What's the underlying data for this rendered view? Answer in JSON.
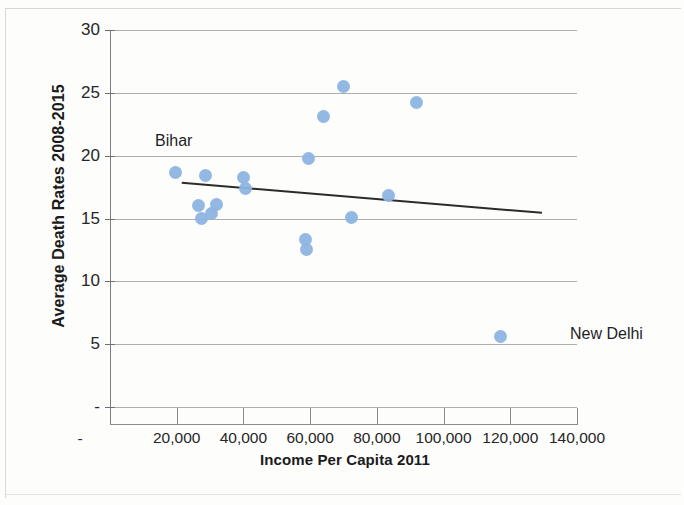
{
  "chart_data": {
    "type": "scatter",
    "title": "",
    "xlabel": "Income Per Capita 2011",
    "ylabel": "Average Death Rates 2008-2015",
    "xlim": [
      0,
      140000
    ],
    "ylim": [
      0,
      30
    ],
    "xticks": [
      0,
      20000,
      40000,
      60000,
      80000,
      100000,
      120000,
      140000
    ],
    "xticklabels": [
      "-",
      "20,000",
      "40,000",
      "60,000",
      "80,000",
      "100,000",
      "120,000",
      "140,000"
    ],
    "yticks": [
      0,
      5,
      10,
      15,
      20,
      25,
      30
    ],
    "yticklabels": [
      "-",
      "5",
      "10",
      "15",
      "20",
      "25",
      "30"
    ],
    "grid": "horizontal",
    "legend": "none",
    "marker_color": "#8db4e2",
    "trendline_color": "#2b2b2b",
    "points": [
      {
        "x": 19500,
        "y": 18.7
      },
      {
        "x": 26500,
        "y": 16.0
      },
      {
        "x": 27500,
        "y": 15.0
      },
      {
        "x": 28500,
        "y": 18.4
      },
      {
        "x": 30500,
        "y": 15.4
      },
      {
        "x": 32000,
        "y": 16.1
      },
      {
        "x": 40000,
        "y": 18.3
      },
      {
        "x": 40500,
        "y": 17.4
      },
      {
        "x": 58500,
        "y": 13.3
      },
      {
        "x": 59000,
        "y": 12.5
      },
      {
        "x": 59500,
        "y": 19.8
      },
      {
        "x": 64000,
        "y": 23.1
      },
      {
        "x": 70000,
        "y": 25.5
      },
      {
        "x": 72500,
        "y": 15.1
      },
      {
        "x": 83500,
        "y": 16.8
      },
      {
        "x": 92000,
        "y": 24.2
      },
      {
        "x": 117000,
        "y": 5.6
      }
    ],
    "trendline": {
      "x0": 21500,
      "y0": 17.85,
      "x1": 129500,
      "y1": 15.45
    },
    "annotations": [
      {
        "text": "Bihar",
        "x": 19500,
        "y": 18.7,
        "label_x": 155,
        "label_y": 132
      },
      {
        "text": "New Delhi",
        "x": 117000,
        "y": 5.6,
        "label_x": 570,
        "label_y": 325
      }
    ]
  },
  "axes": {
    "y_title": "Average Death Rates 2008-2015",
    "x_title": "Income Per Capita 2011"
  }
}
